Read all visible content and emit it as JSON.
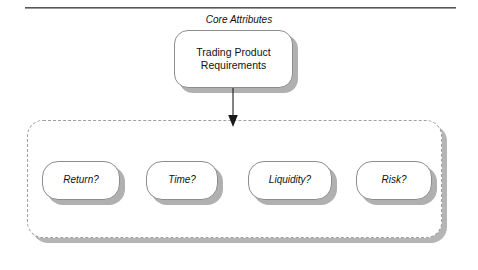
{
  "page": {
    "background_color": "#ffffff",
    "rule_color": "#555555"
  },
  "diagram": {
    "type": "block-hierarchy",
    "root": {
      "label": "Trading Product\nRequirements",
      "style": "rounded-rectangle",
      "fill": "#ffffff",
      "border_color": "#8d8d8d",
      "shadow_color": "#b0b0b0"
    },
    "connector": {
      "kind": "arrow",
      "direction": "down",
      "from": "root",
      "to": "core-attributes-group",
      "color": "#1a1a1a"
    },
    "group": {
      "title": "Core Attributes",
      "border_style": "dashed",
      "border_color": "#a0a0a0",
      "fill": "#ffffff",
      "shadow_color": "#b5b5b5",
      "items": [
        {
          "label": "Return?"
        },
        {
          "label": "Time?"
        },
        {
          "label": "Liquidity?"
        },
        {
          "label": "Risk?"
        }
      ]
    }
  }
}
